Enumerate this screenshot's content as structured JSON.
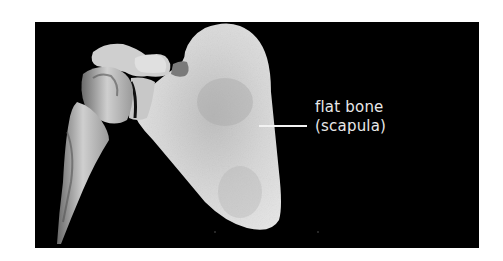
{
  "figure": {
    "background_color": "#000000",
    "bone_color": "#d9d9d9",
    "callout": {
      "line1": "flat bone",
      "line2": "(scapula)",
      "text_color": "#e8e8e8"
    }
  }
}
